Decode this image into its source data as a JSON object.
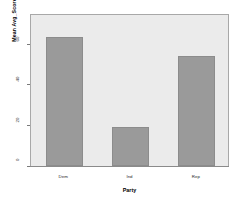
{
  "chart_data": {
    "type": "bar",
    "title": "",
    "subtitle": "",
    "xlabel": "Party",
    "ylabel": "Mean Avg_Score",
    "categories": [
      "Dem",
      "Ind",
      "Rep"
    ],
    "values": [
      63,
      19,
      54
    ],
    "series": [
      {
        "name": "Mean Avg_Score",
        "values": [
          63,
          19,
          54
        ]
      }
    ],
    "ylim": [
      0,
      75
    ],
    "xlim_categories": 3,
    "yticks": [
      0,
      20,
      40,
      60
    ],
    "ytick_labels": [
      "0",
      "20",
      "40",
      "60"
    ],
    "xtick_labels": [
      "Dem",
      "Ind",
      "Rep"
    ],
    "grid": false,
    "legend": false,
    "legend_position": "none",
    "colors": {
      "bar_fill": "#9a9a9a",
      "bar_edge": "#8c8c8c",
      "plot_background": "#ebebeb",
      "plot_border": "#a8a8a8",
      "figure_background": "#ffffff",
      "axis_line": "#8a8a8a",
      "text": "#000000"
    }
  },
  "axes": {
    "y": {
      "title": "Mean Avg_Score",
      "ticks": [
        {
          "label": "60",
          "value": 60
        },
        {
          "label": "40",
          "value": 40
        },
        {
          "label": "20",
          "value": 20
        },
        {
          "label": "0",
          "value": 0
        }
      ]
    },
    "x": {
      "title": "Party",
      "ticks": [
        {
          "label": "Dem"
        },
        {
          "label": "Ind"
        },
        {
          "label": "Rep"
        }
      ]
    }
  }
}
